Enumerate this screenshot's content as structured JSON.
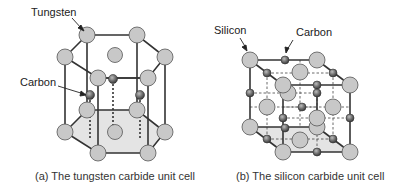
{
  "panel_a": {
    "caption": "(a)  The tungsten carbide unit cell",
    "labels": {
      "tungsten": "Tungsten",
      "carbon": "Carbon"
    }
  },
  "panel_b": {
    "caption": "(b)  The silicon carbide unit cell",
    "labels": {
      "silicon": "Silicon",
      "carbon": "Carbon"
    }
  },
  "colors": {
    "large_atom": "#c8c8c8",
    "small_atom": "#6e6e6e",
    "bond": "#333333",
    "shaded_face": "#e6e6e6"
  }
}
